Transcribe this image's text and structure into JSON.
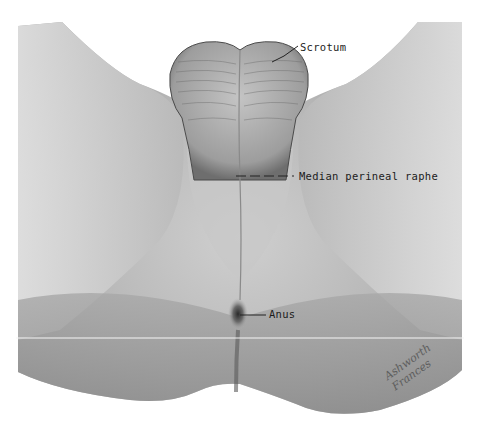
{
  "figure": {
    "labels": {
      "scrotum": "Scrotum",
      "median_perineal_raphe": "Median perineal raphe",
      "anus": "Anus"
    },
    "signature": "Ashworth Frances"
  },
  "colors": {
    "background": "#ffffff",
    "skin_light": "#d6d6d6",
    "skin_mid": "#b8b8b8",
    "skin_dark": "#8a8a8a",
    "label_text": "#1c1c1c",
    "leader_line": "#222222"
  }
}
